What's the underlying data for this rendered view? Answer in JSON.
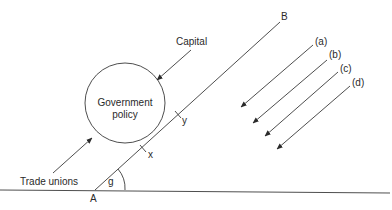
{
  "diagram": {
    "circle_label_line1": "Government",
    "circle_label_line2": "policy",
    "capital_label": "Capital",
    "trade_unions_label": "Trade unions",
    "point_a_label": "A",
    "point_b_label": "B",
    "point_x_label": "x",
    "point_y_label": "y",
    "angle_label": "g",
    "arrow_labels": [
      "(a)",
      "(b)",
      "(c)",
      "(d)"
    ]
  }
}
